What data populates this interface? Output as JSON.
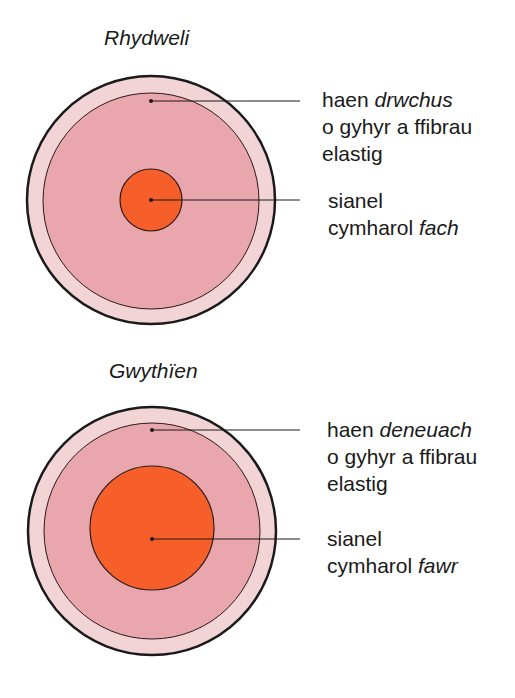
{
  "colors": {
    "outer_ring": "#f2d3d6",
    "middle_layer": "#e9a6ac",
    "lumen": "#f65e2a",
    "outline": "#1a1a1a",
    "background": "#ffffff"
  },
  "artery": {
    "title": "Rhydweli",
    "wall_label": {
      "line1_prefix": "haen ",
      "line1_emph": "drwchus",
      "line2": "o gyhyr a ffibrau",
      "line3": "elastig"
    },
    "lumen_label": {
      "line1": "sianel",
      "line2_prefix": "cymharol ",
      "line2_emph": "fach"
    }
  },
  "vein": {
    "title": "Gwythïen",
    "wall_label": {
      "line1_prefix": "haen ",
      "line1_emph": "deneuach",
      "line2": "o gyhyr a ffibrau",
      "line3": "elastig"
    },
    "lumen_label": {
      "line1": "sianel",
      "line2_prefix": "cymharol ",
      "line2_emph": "fawr"
    }
  }
}
